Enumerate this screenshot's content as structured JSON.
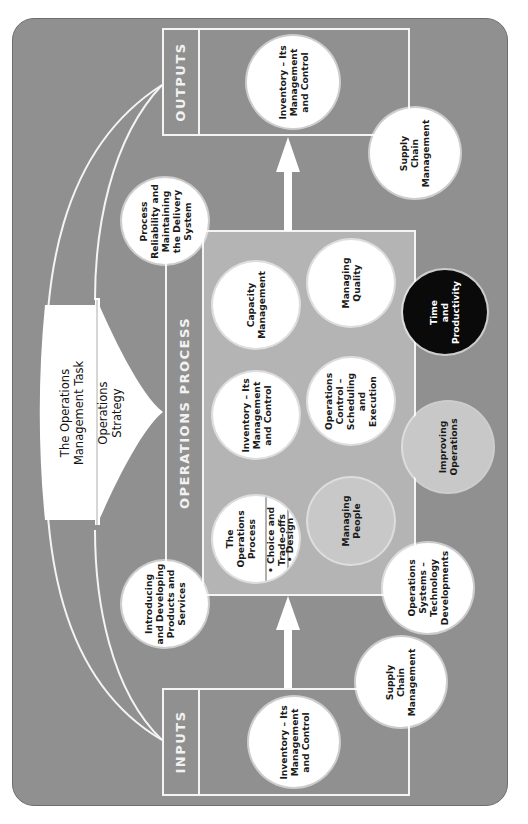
{
  "diagram": {
    "title": "The Operations Management Task",
    "strategy": "Operations Strategy",
    "title_lines": [
      "The Operations",
      "Management Task"
    ],
    "strategy_lines": [
      "Operations",
      "Strategy"
    ],
    "colors": {
      "panel": "#909090",
      "process_area": "#b4b4b4",
      "lines": "#f4f4f4",
      "circle_white": "#ffffff",
      "circle_gray": "#c8c8c8",
      "circle_black": "#0a0a0a"
    },
    "outputs": {
      "label": "OUTPUTS",
      "circles": [
        {
          "lines": [
            "Inventory – Its",
            "Management",
            "and Control"
          ]
        },
        {
          "lines": [
            "Supply",
            "Chain",
            "Management"
          ]
        }
      ]
    },
    "inputs": {
      "label": "INPUTS",
      "circles": [
        {
          "lines": [
            "Inventory – Its",
            "Management",
            "and Control"
          ]
        },
        {
          "lines": [
            "Supply",
            "Chain",
            "Management"
          ]
        }
      ]
    },
    "operations_process": {
      "label": "OPERATIONS PROCESS",
      "circles": [
        {
          "lines": [
            "Capacity",
            "Management"
          ]
        },
        {
          "lines": [
            "Managing",
            "Quality"
          ]
        },
        {
          "lines": [
            "Inventory – Its",
            "Management",
            "and Control"
          ]
        },
        {
          "lines": [
            "Operations",
            "Control –",
            "Scheduling",
            "and",
            "Execution"
          ]
        },
        {
          "lines": [
            "Managing",
            "People"
          ]
        },
        {
          "lines": [
            "Time",
            "and",
            "Productivity"
          ]
        },
        {
          "lines": [
            "Improving",
            "Operations"
          ]
        }
      ],
      "process_circle": {
        "header_lines": [
          "The",
          "Operations",
          "Process"
        ],
        "bullets": [
          [
            "• Choice and",
            "Trade-offs"
          ],
          [
            "• Design"
          ]
        ]
      }
    },
    "border_circles": [
      {
        "lines": [
          "Process",
          "Reliability and",
          "Maintaining",
          "the Delivery",
          "System"
        ]
      },
      {
        "lines": [
          "Introducing",
          "and Developing",
          "Products and",
          "Services"
        ]
      },
      {
        "lines": [
          "Operations",
          "Systems –",
          "Technology",
          "Developments"
        ]
      }
    ]
  }
}
